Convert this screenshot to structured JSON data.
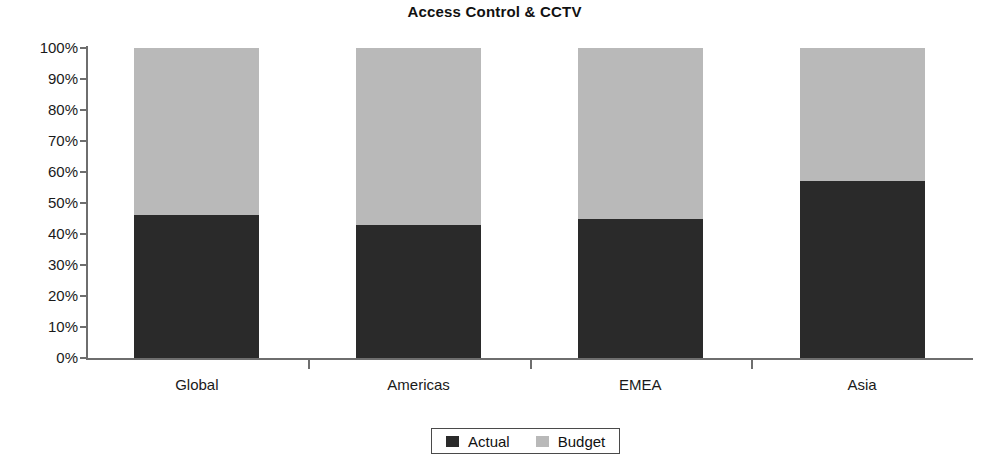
{
  "chart_data": {
    "type": "bar",
    "subtype": "stacked-percent",
    "title": "Access Control & CCTV",
    "xlabel": "",
    "ylabel": "",
    "ylim": [
      0,
      100
    ],
    "ytick_labels": [
      "100%",
      "90%",
      "80%",
      "70%",
      "60%",
      "50%",
      "40%",
      "30%",
      "20%",
      "10%",
      "0%"
    ],
    "ytick_values": [
      100,
      90,
      80,
      70,
      60,
      50,
      40,
      30,
      20,
      10,
      0
    ],
    "grid": false,
    "legend_position": "bottom-center",
    "categories": [
      "Global",
      "Americas",
      "EMEA",
      "Asia"
    ],
    "series": [
      {
        "name": "Actual",
        "color": "#2a2a2a",
        "values": [
          46,
          43,
          45,
          57
        ]
      },
      {
        "name": "Budget",
        "color": "#b9b9b9",
        "values": [
          54,
          57,
          55,
          43
        ]
      }
    ]
  },
  "legend": {
    "entries": [
      {
        "label": "Actual",
        "color": "#2a2a2a"
      },
      {
        "label": "Budget",
        "color": "#b9b9b9"
      }
    ]
  },
  "colors": {
    "actual": "#2a2a2a",
    "budget": "#b9b9b9",
    "axis": "#6e6e6e",
    "text": "#1a1a1a",
    "background": "#ffffff"
  }
}
